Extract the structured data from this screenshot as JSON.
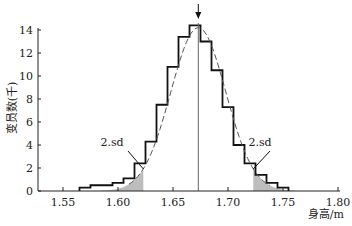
{
  "chart_data": {
    "type": "bar",
    "title": "",
    "xlabel": "身高/m",
    "ylabel": "变员数(千)",
    "xlim": [
      1.53,
      1.8
    ],
    "ylim": [
      0,
      14
    ],
    "xticks": [
      "1.55",
      "1.60",
      "1.65",
      "1.70",
      "1.75",
      "1.80"
    ],
    "xtick_values": [
      1.55,
      1.6,
      1.65,
      1.7,
      1.75,
      1.8
    ],
    "yticks": [
      "0",
      "2",
      "4",
      "6",
      "8",
      "10",
      "12",
      "14"
    ],
    "ytick_values": [
      0,
      2,
      4,
      6,
      8,
      10,
      12,
      14
    ],
    "bin_width": 0.01,
    "categories": [
      1.57,
      1.58,
      1.59,
      1.6,
      1.61,
      1.62,
      1.63,
      1.64,
      1.65,
      1.66,
      1.67,
      1.68,
      1.69,
      1.7,
      1.71,
      1.72,
      1.73,
      1.74,
      1.75
    ],
    "values": [
      0.3,
      0.5,
      0.5,
      0.7,
      1.1,
      2.4,
      4.3,
      7.5,
      10.8,
      13.4,
      14.4,
      13.0,
      10.5,
      7.3,
      4.0,
      2.4,
      1.4,
      0.7,
      0.3
    ],
    "normal_fit": {
      "mean": 1.673,
      "sd": 0.025,
      "peak": 14.2
    },
    "mean_marker": 1.673,
    "shaded_tails_beyond_sd": 2,
    "annotations": [
      {
        "text": "2.sd",
        "side": "left"
      },
      {
        "text": "2.sd",
        "side": "right"
      }
    ],
    "grid": false,
    "legend": "none"
  }
}
